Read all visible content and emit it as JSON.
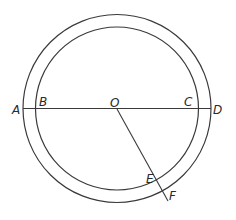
{
  "diagram": {
    "type": "concentric-circles",
    "center": {
      "label": "O",
      "x": 117,
      "y": 108
    },
    "outer_circle": {
      "r": 94
    },
    "inner_circle": {
      "r": 81
    },
    "points": [
      {
        "label": "A",
        "x": 14,
        "y": 113
      },
      {
        "label": "B",
        "x": 40,
        "y": 105
      },
      {
        "label": "O",
        "x": 111,
        "y": 106
      },
      {
        "label": "C",
        "x": 183,
        "y": 106
      },
      {
        "label": "D",
        "x": 213,
        "y": 113
      },
      {
        "label": "E",
        "x": 146,
        "y": 182
      },
      {
        "label": "F",
        "x": 168,
        "y": 198
      }
    ],
    "segments": [
      {
        "from": "A",
        "to": "D",
        "description": "diameter through B, O, C"
      },
      {
        "from": "O",
        "to": "F",
        "description": "radius through E"
      }
    ],
    "stroke_color": "#3a3a3a"
  }
}
